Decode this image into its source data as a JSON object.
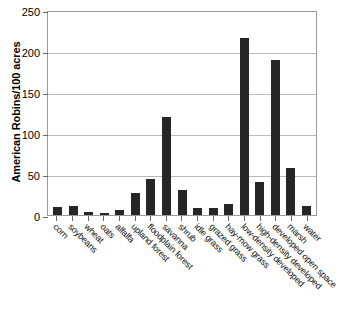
{
  "chart_data": {
    "type": "bar",
    "title": "",
    "subtitle": "",
    "xlabel": "",
    "ylabel": "American Robins/100 acres",
    "ylim": [
      0,
      250
    ],
    "yticks": [
      0,
      50,
      100,
      150,
      200,
      250
    ],
    "ytick_labels": [
      "0",
      "50",
      "100",
      "150",
      "200",
      "250"
    ],
    "grid": true,
    "legend": "none",
    "bar_color": "#262626",
    "categories": [
      "corn",
      "soybeans",
      "wheat",
      "oats",
      "alfalfa",
      "upland forest",
      "floodplain forest",
      "savanna",
      "shrub",
      "idle grass",
      "grazed grass",
      "hay-mow grass",
      "low-density developed",
      "high-density developed",
      "developed open space",
      "marsh",
      "water"
    ],
    "values": [
      10,
      11,
      4,
      3,
      6,
      27,
      44,
      120,
      31,
      9,
      9,
      13,
      216,
      40,
      189,
      57,
      11
    ]
  }
}
